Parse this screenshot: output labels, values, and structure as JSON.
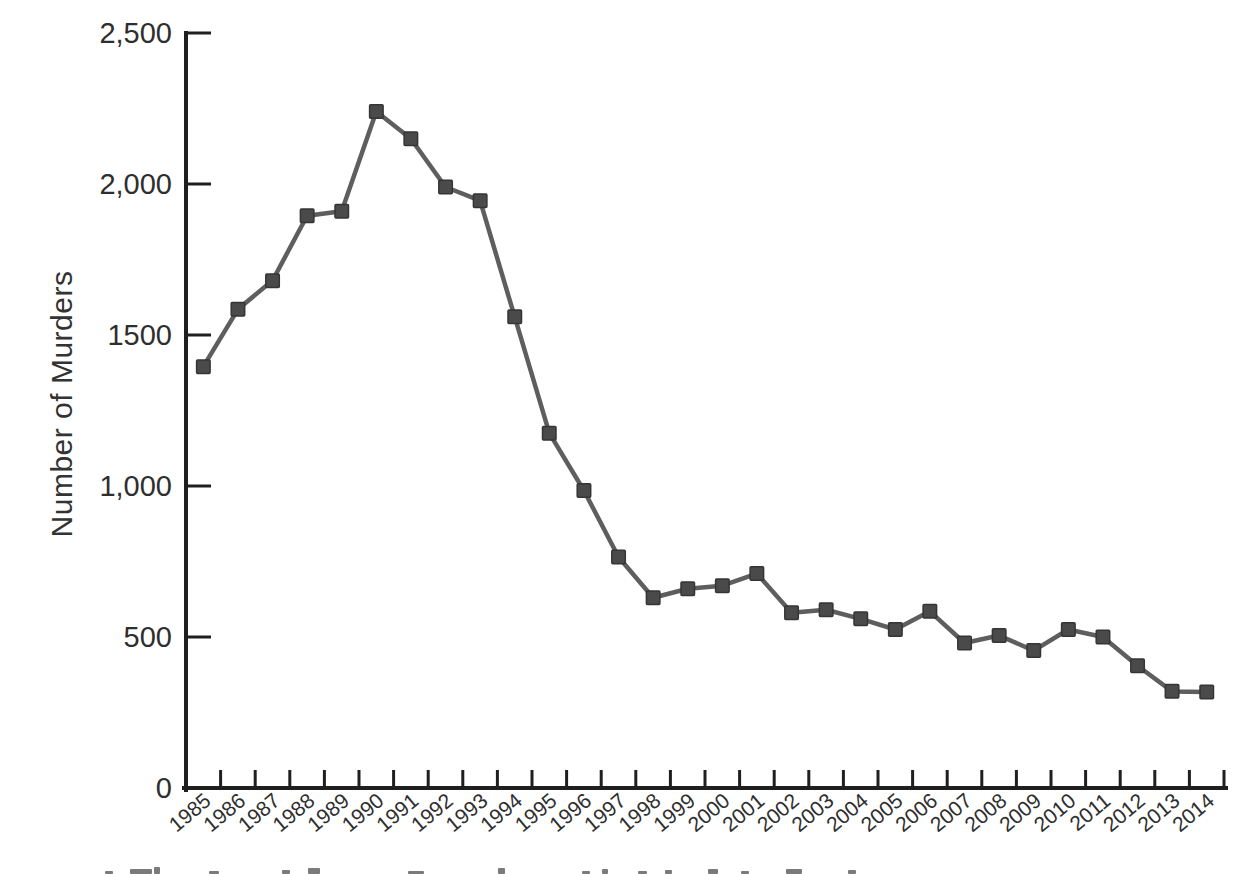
{
  "figure": {
    "kind": "scanned-book-figure",
    "background": "#ffffff",
    "axis_color": "#1f1f1f",
    "line_color": "#5e5e5e",
    "marker_fill": "#4a4a4a",
    "marker_stroke": "#353535",
    "label_color": "#2e2e2e"
  },
  "chart_data": {
    "type": "line",
    "title": "",
    "xlabel": "",
    "ylabel": "Number of Murders",
    "marker": "square",
    "grid": false,
    "legend": "none",
    "ylim": [
      0,
      2500
    ],
    "y_tick_values": [
      0,
      500,
      1000,
      1500,
      2000,
      2500
    ],
    "y_tick_labels": [
      "0",
      "500",
      "1,000",
      "1500",
      "2,000",
      "2,500"
    ],
    "categories": [
      "1985",
      "1986",
      "1987",
      "1988",
      "1989",
      "1990",
      "1991",
      "1992",
      "1993",
      "1994",
      "1995",
      "1996",
      "1997",
      "1998",
      "1999",
      "2000",
      "2001",
      "2002",
      "2003",
      "2004",
      "2005",
      "2006",
      "2007",
      "2008",
      "2009",
      "2010",
      "2011",
      "2012",
      "2013",
      "2014"
    ],
    "values": [
      1395,
      1585,
      1680,
      1895,
      1910,
      2240,
      2150,
      1990,
      1945,
      1560,
      1175,
      985,
      765,
      630,
      660,
      670,
      710,
      580,
      590,
      560,
      525,
      585,
      480,
      505,
      455,
      525,
      500,
      405,
      320,
      318
    ]
  }
}
